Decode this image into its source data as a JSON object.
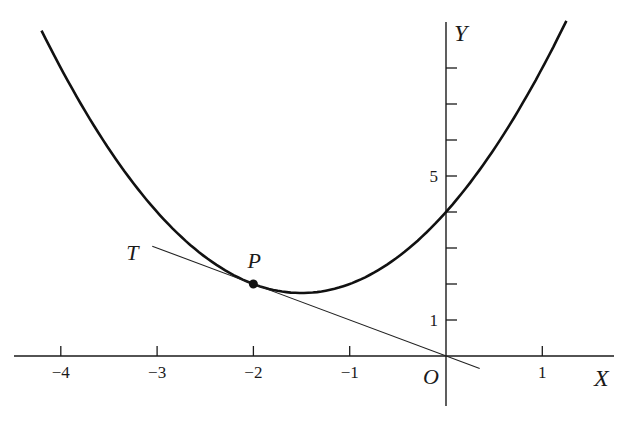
{
  "chart_data": {
    "type": "line",
    "title": "",
    "xlabel": "X",
    "ylabel": "Y",
    "origin_label": "O",
    "xlim": [
      -4.4,
      1.75
    ],
    "ylim": [
      -1.2,
      9.3
    ],
    "grid": false,
    "x_ticks": [
      -4,
      -3,
      -2,
      -1,
      1
    ],
    "x_tick_labels": [
      "−4",
      "−3",
      "−2",
      "−1",
      "1"
    ],
    "y_ticks": [
      1,
      2,
      3,
      4,
      5,
      6,
      7,
      8
    ],
    "y_tick_labels": {
      "1": "1",
      "5": "5"
    },
    "series": [
      {
        "name": "curve",
        "equation": "y = x^2 + 3x + 4",
        "x": [
          -4.2,
          -4,
          -3.5,
          -3,
          -2.5,
          -2,
          -1.5,
          -1,
          -0.5,
          0,
          0.5,
          1,
          1.25
        ],
        "y": [
          9.04,
          8,
          5.75,
          4,
          2.75,
          2,
          1.75,
          2,
          2.75,
          4,
          5.75,
          8,
          9.31
        ]
      },
      {
        "name": "tangent TP",
        "equation": "y = -x",
        "x": [
          -3.05,
          0.35
        ],
        "y": [
          3.05,
          -0.35
        ]
      }
    ],
    "annotations": [
      {
        "label": "P",
        "x": -2,
        "y": 2,
        "marker": "point"
      },
      {
        "label": "T",
        "x": -3.05,
        "y": 3.05
      }
    ]
  }
}
